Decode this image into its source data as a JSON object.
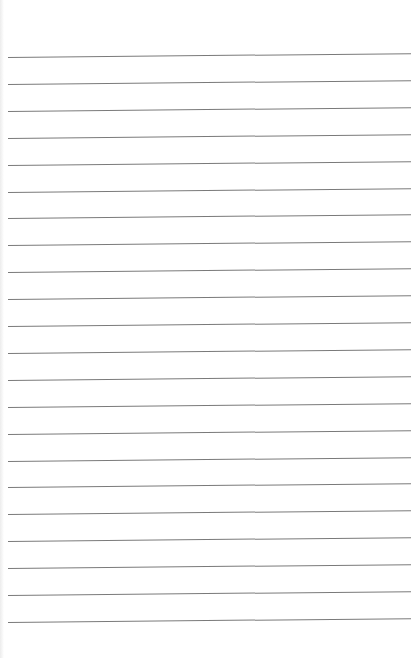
{
  "page": {
    "type": "lined-paper",
    "background": "#ffffff",
    "line_color": "#7a7a7a",
    "line_count": 22,
    "first_line_y": 57,
    "line_spacing": 26.9
  }
}
